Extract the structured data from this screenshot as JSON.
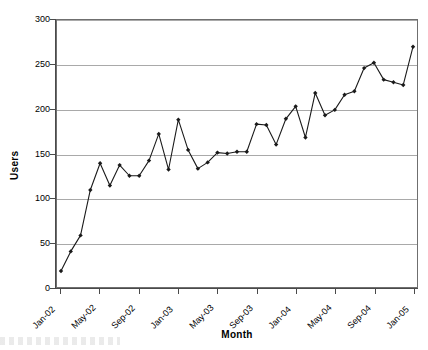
{
  "chart_data": {
    "type": "line",
    "title": "",
    "xlabel": "Month",
    "ylabel": "Users",
    "ylim": [
      0,
      300
    ],
    "ytick_values": [
      0,
      50,
      100,
      150,
      200,
      250,
      300
    ],
    "ytick_labels": [
      "0",
      "50",
      "100",
      "150",
      "200",
      "250",
      "300"
    ],
    "grid": "horizontal",
    "legend": "none",
    "marker": "diamond",
    "line_color": "#1a1a1a",
    "marker_color": "#1a1a1a",
    "gridline_color": "#a9a9a9",
    "axis_color": "#4a4a4a",
    "xtick_labels": [
      "Jan-02",
      "May-02",
      "Sep-02",
      "Jan-03",
      "May-03",
      "Sep-03",
      "Jan-04",
      "May-04",
      "Sep-04",
      "Jan-05"
    ],
    "xtick_indices": [
      0,
      4,
      8,
      12,
      16,
      20,
      24,
      28,
      32,
      36
    ],
    "x": [
      "Jan-02",
      "Feb-02",
      "Mar-02",
      "Apr-02",
      "May-02",
      "Jun-02",
      "Jul-02",
      "Aug-02",
      "Sep-02",
      "Oct-02",
      "Nov-02",
      "Dec-02",
      "Jan-03",
      "Feb-03",
      "Mar-03",
      "Apr-03",
      "May-03",
      "Jun-03",
      "Jul-03",
      "Aug-03",
      "Sep-03",
      "Oct-03",
      "Nov-03",
      "Dec-03",
      "Jan-04",
      "Feb-04",
      "Mar-04",
      "Apr-04",
      "May-04",
      "Jun-04",
      "Jul-04",
      "Aug-04",
      "Sep-04",
      "Oct-04",
      "Nov-04",
      "Dec-04",
      "Jan-05"
    ],
    "values": [
      18,
      40,
      58,
      109,
      139,
      114,
      137,
      125,
      125,
      142,
      172,
      132,
      188,
      154,
      133,
      140,
      151,
      150,
      152,
      152,
      183,
      182,
      160,
      189,
      203,
      168,
      218,
      193,
      199,
      216,
      220,
      246,
      252,
      233,
      230,
      227,
      270
    ],
    "series": [
      {
        "name": "Users",
        "values": [
          18,
          40,
          58,
          109,
          139,
          114,
          137,
          125,
          125,
          142,
          172,
          132,
          188,
          154,
          133,
          140,
          151,
          150,
          152,
          152,
          183,
          182,
          160,
          189,
          203,
          168,
          218,
          193,
          199,
          216,
          220,
          246,
          252,
          233,
          230,
          227,
          270
        ]
      }
    ]
  }
}
